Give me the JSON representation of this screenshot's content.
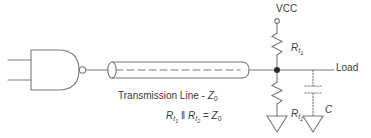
{
  "diagram": {
    "colors": {
      "stroke": "#7a7a7a",
      "text": "#3a3a3a",
      "background": "#ffffff",
      "node_fill": "#2b2b2b"
    },
    "labels": {
      "vcc": "VCC",
      "load": "Load",
      "transmission_line": "Transmission Line - ",
      "transmission_line_z": "Z",
      "transmission_line_z_sub": "0",
      "capacitor": "C",
      "resistor_top_r": "R",
      "resistor_top_sub_t": "t",
      "resistor_top_sub_n": "1",
      "resistor_bottom_r": "R",
      "resistor_bottom_sub_t": "t",
      "resistor_bottom_sub_n": "2",
      "formula_r1": "R",
      "formula_r1_sub_t": "t",
      "formula_r1_sub_n": "1",
      "formula_parallel": " ‖ ",
      "formula_r2": "R",
      "formula_r2_sub_t": "t",
      "formula_r2_sub_n": "2",
      "formula_equals": " = ",
      "formula_z": "Z",
      "formula_z_sub": "0"
    },
    "components": {
      "nand_gate": "nand-gate",
      "inversion_bubble": "inversion-bubble",
      "input_line_1": "gate-input-1",
      "input_line_2": "gate-input-2",
      "transmission_line": "transmission-line-cylinder",
      "junction_node": "junction-dot",
      "vcc_terminal": "vcc-terminal-circle",
      "resistor_top": "resistor-rt1",
      "resistor_bottom": "resistor-rt2",
      "capacitor": "capacitor-c",
      "ground_left": "ground-symbol-rt2",
      "ground_right": "ground-symbol-capacitor",
      "load_wire": "load-wire"
    }
  }
}
